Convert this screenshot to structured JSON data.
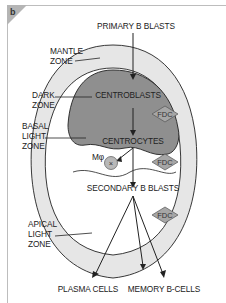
{
  "panel_label": "b",
  "labels": {
    "primary_b_blasts": "PRIMARY B BLASTS",
    "mantle_zone": [
      "MANTLE",
      "ZONE"
    ],
    "dark_zone": [
      "DARK",
      "ZONE"
    ],
    "basal_light_zone": [
      "BASAL",
      "LIGHT",
      "ZONE"
    ],
    "apical_light_zone": [
      "APICAL",
      "LIGHT",
      "ZONE"
    ],
    "centroblasts": "CENTROBLASTS",
    "centrocytes": "CENTROCYTES",
    "macrophage": "Mφ",
    "secondary_b_blasts": "SECONDARY B BLASTS",
    "plasma_cells": "PLASMA CELLS",
    "memory_b_cells": "MEMORY B-CELLS",
    "fdc": "FDC"
  },
  "colors": {
    "mantle": "#e6e6e6",
    "dark_zone": "#8f8f8f",
    "light_zone": "#ffffff",
    "fdc_fill": "#a6a6a6",
    "macrophage_fill": "#b8b8b8",
    "stroke": "#222222"
  }
}
